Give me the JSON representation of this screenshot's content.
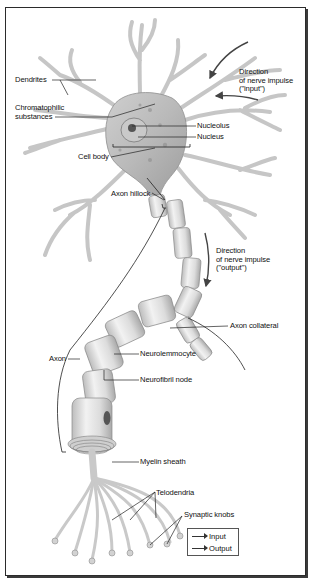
{
  "figure": {
    "labels": {
      "dendrites": "Dendrites",
      "chromatophilic": "Chromatophilic\nsubstances",
      "nucleolus": "Nucleolus",
      "nucleus": "Nucleus",
      "cell_body": "Cell body",
      "direction_input": "Direction\nof nerve impulse\n(\"input\")",
      "axon_hillock": "Axon hillock",
      "direction_output": "Direction\nof nerve impulse\n(\"output\")",
      "axon": "Axon",
      "axon_collateral": "Axon collateral",
      "neurolemmocyte": "Neurolemmocyte",
      "neurofibril_node": "Neurofibril node",
      "myelin_sheath": "Myelin sheath",
      "telodendria": "Telodendria",
      "synaptic_knobs": "Synaptic knobs"
    },
    "legend": {
      "items": [
        {
          "label": "Input",
          "icon": "arrow-right-icon"
        },
        {
          "label": "Output",
          "icon": "arrow-right-icon"
        }
      ]
    },
    "colors": {
      "frame": "#2b2b2b",
      "cell_fill": "#d9d9d9",
      "cell_shade": "#a8a8a8",
      "leader_line": "#222222",
      "arrow": "#444444"
    }
  }
}
